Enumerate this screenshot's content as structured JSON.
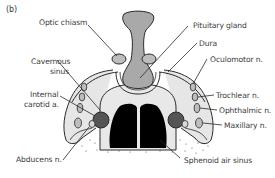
{
  "figure": {
    "panel_label": "(b)",
    "colors": {
      "outline": "#2a2a2a",
      "pituitary": "#a9a9a9",
      "sinus_fill": "#dcdcdc",
      "carotid": "#555555",
      "air_sinus": "#000000",
      "nerve": "#bdbdbd",
      "text": "#3a3a3a"
    },
    "labels": {
      "optic_chiasm": "Optic chiasm",
      "cavernous_sinus_1": "Cavernous",
      "cavernous_sinus_2": "sinus",
      "internal_carotid_1": "Internal",
      "internal_carotid_2": "carotid a.",
      "abducens": "Abducens n.",
      "pituitary": "Pituitary gland",
      "dura": "Dura",
      "oculomotor": "Oculomotor n.",
      "trochlear": "Trochlear n.",
      "ophthalmic": "Ophthalmic n.",
      "maxillary": "Maxillary n.",
      "sphenoid": "Sphenoid air sinus"
    }
  }
}
